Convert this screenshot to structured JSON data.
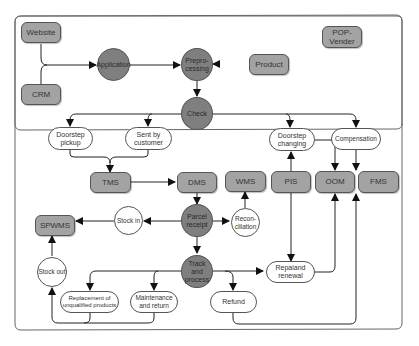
{
  "diagram": {
    "title_caption": "",
    "colors": {
      "gray_box": "#a3a3a3",
      "dark_circle": "#7f7f7f",
      "white_node": "#ffffff",
      "stroke": "#333333",
      "frame": "#666666"
    },
    "nodes": {
      "website": "Website",
      "crm": "CRM",
      "application": "Application",
      "preprocessing": "Prepro-\ncessing",
      "product": "Product",
      "pop_vender": "POP-\nVender",
      "check": "Check",
      "doorstep_pickup": "Doorstep\npickup",
      "sent_by_customer": "Sent by\ncustomer",
      "doorstep_changing": "Doorstep\nchanging",
      "compensation": "Compensation",
      "tms": "TMS",
      "dms": "DMS",
      "wms": "WMS",
      "pis": "PIS",
      "oom": "OOM",
      "fms": "FMS",
      "spwms": "SPWMS",
      "stock_in": "Stock in",
      "parcel_receipt": "Parcel\nreceipt",
      "reconciliation": "Recon-\nciliation",
      "stock_out": "Stock out",
      "track_and_process": "Track and\nprocess",
      "repair_and_renewal": "Repaiand\nrenewal",
      "replacement": "Replacement of\nunqualified products",
      "maintenance": "Maintenance\nand return",
      "refund": "Refund"
    },
    "edges": [
      [
        "website",
        "application"
      ],
      [
        "crm",
        "application"
      ],
      [
        "application",
        "preprocessing"
      ],
      [
        "product",
        "preprocessing"
      ],
      [
        "preprocessing",
        "check"
      ],
      [
        "check",
        "doorstep_pickup"
      ],
      [
        "check",
        "sent_by_customer"
      ],
      [
        "check",
        "doorstep_changing"
      ],
      [
        "check",
        "compensation"
      ],
      [
        "doorstep_pickup",
        "tms"
      ],
      [
        "sent_by_customer",
        "tms"
      ],
      [
        "tms",
        "dms"
      ],
      [
        "dms",
        "parcel_receipt"
      ],
      [
        "pis",
        "doorstep_changing"
      ],
      [
        "doorstep_changing",
        "oom"
      ],
      [
        "compensation",
        "fms"
      ],
      [
        "parcel_receipt",
        "stock_in"
      ],
      [
        "stock_in",
        "spwms"
      ],
      [
        "parcel_receipt",
        "reconciliation"
      ],
      [
        "reconciliation",
        "wms"
      ],
      [
        "parcel_receipt",
        "track_and_process"
      ],
      [
        "stock_out",
        "spwms"
      ],
      [
        "track_and_process",
        "replacement"
      ],
      [
        "track_and_process",
        "maintenance"
      ],
      [
        "track_and_process",
        "repair_and_renewal"
      ],
      [
        "track_and_process",
        "refund"
      ],
      [
        "pis",
        "repair_and_renewal"
      ],
      [
        "repair_and_renewal",
        "oom"
      ],
      [
        "replacement",
        "stock_out"
      ],
      [
        "maintenance",
        "stock_out"
      ],
      [
        "refund",
        "fms"
      ],
      [
        "frame_right",
        "fms"
      ]
    ]
  }
}
